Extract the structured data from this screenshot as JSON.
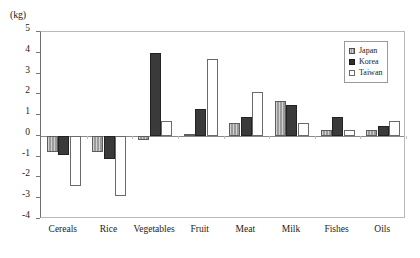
{
  "chart_data": {
    "type": "bar",
    "title": "",
    "subtitle": "",
    "xlabel": "",
    "ylabel": "(kg)",
    "unit_label": "(kg)",
    "ylim": [
      -4,
      5
    ],
    "ytick_step": 1,
    "yticks": [
      "5",
      "4",
      "3",
      "2",
      "1",
      "0",
      "-1",
      "-2",
      "-3",
      "-4"
    ],
    "ytick_values": [
      5,
      4,
      3,
      2,
      1,
      0,
      -1,
      -2,
      -3,
      -4
    ],
    "grid": false,
    "zero_line": true,
    "legend_position": "top-right",
    "categories": [
      "Cereals",
      "Rice",
      "Vegetables",
      "Fruit",
      "Meat",
      "Milk",
      "Fishes",
      "Oils"
    ],
    "series": [
      {
        "name": "Japan",
        "color": "#9a9a9a",
        "values": [
          -0.8,
          -0.8,
          -0.2,
          0.1,
          0.6,
          1.7,
          0.3,
          0.3
        ]
      },
      {
        "name": "Korea",
        "color": "#3a3a3a",
        "values": [
          -0.9,
          -1.1,
          4.0,
          1.3,
          0.9,
          1.5,
          0.9,
          0.5
        ]
      },
      {
        "name": "Taiwan",
        "color": "#ffffff",
        "values": [
          -2.4,
          -2.9,
          0.7,
          3.7,
          2.1,
          0.6,
          0.3,
          0.7
        ]
      }
    ]
  },
  "legend": {
    "items": [
      {
        "label": "Japan"
      },
      {
        "label": "Korea"
      },
      {
        "label": "Taiwan"
      }
    ]
  }
}
